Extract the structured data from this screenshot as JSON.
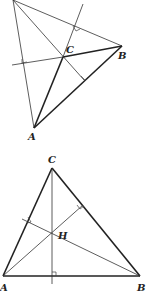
{
  "figures": [
    {
      "id": "obtuse-triangle",
      "description": "Triangle ABC with obtuse angle at C; altitudes extended meet outside the triangle",
      "labels": {
        "C": "C",
        "B": "B",
        "A": "A"
      },
      "right_angle_marks": 3
    },
    {
      "id": "acute-triangle",
      "description": "Triangle ABC with altitudes meeting at orthocenter H inside",
      "labels": {
        "C": "C",
        "H": "H",
        "A": "A",
        "B": "B"
      },
      "right_angle_marks": 3
    }
  ]
}
